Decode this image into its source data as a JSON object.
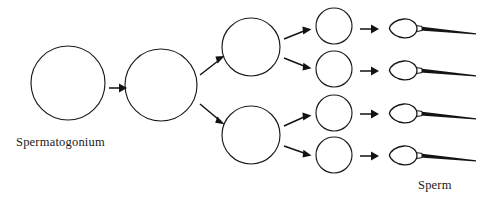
{
  "diagram": {
    "background_color": "#ffffff",
    "stroke_color": "#1b1b1b",
    "labels": {
      "start": "Spermatogonium",
      "end": "Sperm"
    },
    "stages": [
      {
        "name": "spermatogonium",
        "label": "Spermatogonium",
        "shape": "circle",
        "count": 1,
        "radius": 37,
        "cells": [
          {
            "cx": 68,
            "cy": 83
          }
        ]
      },
      {
        "name": "primary-spermatocyte",
        "label": "",
        "shape": "circle",
        "count": 1,
        "radius": 36,
        "cells": [
          {
            "cx": 161,
            "cy": 85
          }
        ]
      },
      {
        "name": "secondary-spermatocyte",
        "label": "",
        "shape": "circle",
        "count": 2,
        "radius": 29,
        "cells": [
          {
            "cx": 251,
            "cy": 47
          },
          {
            "cx": 251,
            "cy": 135
          }
        ]
      },
      {
        "name": "spermatid",
        "label": "",
        "shape": "circle",
        "count": 4,
        "radius": 18,
        "cells": [
          {
            "cx": 334,
            "cy": 26
          },
          {
            "cx": 334,
            "cy": 69
          },
          {
            "cx": 334,
            "cy": 113
          },
          {
            "cx": 334,
            "cy": 155
          }
        ]
      },
      {
        "name": "sperm",
        "label": "Sperm",
        "shape": "sperm",
        "count": 4,
        "cells": [
          {
            "x": 398,
            "y": 29
          },
          {
            "x": 398,
            "y": 71
          },
          {
            "x": 398,
            "y": 114
          },
          {
            "x": 398,
            "y": 156
          }
        ]
      }
    ],
    "arrows": [
      {
        "name": "arrow-spermatogonium-to-primary",
        "x1": 109,
        "y1": 88,
        "x2": 125,
        "y2": 88,
        "type": "straight"
      },
      {
        "name": "arrow-primary-to-secondary-upper",
        "x1": 200,
        "y1": 74,
        "x2": 224,
        "y2": 57,
        "type": "diagonal-up"
      },
      {
        "name": "arrow-primary-to-secondary-lower",
        "x1": 200,
        "y1": 104,
        "x2": 224,
        "y2": 123,
        "type": "diagonal-down"
      },
      {
        "name": "arrow-secondary-upper-to-spermatid-1",
        "x1": 284,
        "y1": 38,
        "x2": 311,
        "y2": 29,
        "type": "diagonal-up"
      },
      {
        "name": "arrow-secondary-upper-to-spermatid-2",
        "x1": 284,
        "y1": 58,
        "x2": 311,
        "y2": 69,
        "type": "diagonal-down"
      },
      {
        "name": "arrow-secondary-lower-to-spermatid-3",
        "x1": 284,
        "y1": 125,
        "x2": 311,
        "y2": 114,
        "type": "diagonal-up"
      },
      {
        "name": "arrow-secondary-lower-to-spermatid-4",
        "x1": 284,
        "y1": 146,
        "x2": 311,
        "y2": 156,
        "type": "diagonal-down"
      },
      {
        "name": "arrow-spermatid-1-to-sperm-1",
        "x1": 363,
        "y1": 29,
        "x2": 386,
        "y2": 29,
        "type": "straight"
      },
      {
        "name": "arrow-spermatid-2-to-sperm-2",
        "x1": 363,
        "y1": 71,
        "x2": 386,
        "y2": 71,
        "type": "straight"
      },
      {
        "name": "arrow-spermatid-3-to-sperm-3",
        "x1": 363,
        "y1": 114,
        "x2": 386,
        "y2": 114,
        "type": "straight"
      },
      {
        "name": "arrow-spermatid-4-to-sperm-4",
        "x1": 363,
        "y1": 156,
        "x2": 386,
        "y2": 156,
        "type": "straight"
      }
    ],
    "label_positions": {
      "start": {
        "x": 16,
        "y": 146
      },
      "end": {
        "x": 418,
        "y": 189
      }
    }
  }
}
